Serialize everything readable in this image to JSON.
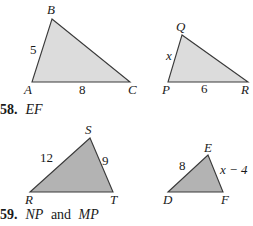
{
  "figures": {
    "top": {
      "triangle_abc": {
        "vertices": {
          "A": "A",
          "B": "B",
          "C": "C"
        },
        "side_ab": "5",
        "side_ac": "8",
        "fill": "#dcdcdc"
      },
      "triangle_pqr": {
        "vertices": {
          "P": "P",
          "Q": "Q",
          "R": "R"
        },
        "side_pq": "x",
        "side_pr": "6",
        "fill": "#dcdcdc"
      }
    },
    "bottom": {
      "triangle_rst": {
        "vertices": {
          "R": "R",
          "S": "S",
          "T": "T"
        },
        "side_rs": "12",
        "side_st": "9",
        "fill": "#b3b3b3"
      },
      "triangle_def": {
        "vertices": {
          "D": "D",
          "E": "E",
          "F": "F"
        },
        "side_de": "8",
        "side_ef": "x − 4",
        "fill": "#b3b3b3"
      }
    }
  },
  "problems": [
    {
      "number": "58.",
      "text_italic": "EF"
    },
    {
      "number": "59.",
      "text_italic_1": "NP",
      "text_plain": " and ",
      "text_italic_2": "MP"
    }
  ]
}
